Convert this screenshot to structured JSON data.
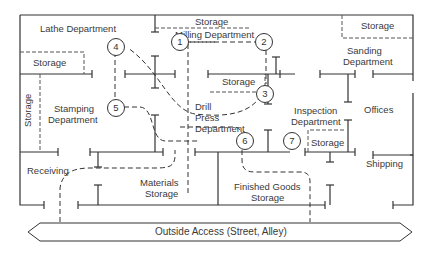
{
  "diagram": {
    "colors": {
      "line": "#333333",
      "text": "#3a3a3a",
      "background": "#ffffff"
    }
  },
  "areas": {
    "lathe": "Lathe Department",
    "storage_top_mid": "Storage",
    "milling": "Milling Department",
    "storage_top_right": "Storage",
    "sanding_1": "Sanding",
    "sanding_2": "Department",
    "storage_left": "Storage",
    "storage_vertical": "Storage",
    "stamping_1": "Stamping",
    "stamping_2": "Department",
    "storage_center": "Storage",
    "drill_1": "Drill",
    "drill_2": "Press",
    "drill_3": "Department",
    "inspection_1": "Inspection",
    "inspection_2": "Department",
    "offices": "Offices",
    "storage_inspection": "Storage",
    "receiving": "Receiving",
    "shipping": "Shipping",
    "materials_1": "Materials",
    "materials_2": "Storage",
    "finished_1": "Finished Goods",
    "finished_2": "Storage",
    "outside_access": "Outside Access (Street, Alley)"
  },
  "nodes": [
    {
      "id": "1",
      "label": "1"
    },
    {
      "id": "2",
      "label": "2"
    },
    {
      "id": "3",
      "label": "3"
    },
    {
      "id": "4",
      "label": "4"
    },
    {
      "id": "5",
      "label": "5"
    },
    {
      "id": "6",
      "label": "6"
    },
    {
      "id": "7",
      "label": "7"
    }
  ],
  "flow_sequence": [
    "Receiving",
    "Materials Storage",
    "Drill Press Department",
    "1",
    "2",
    "3",
    "4",
    "5",
    "6",
    "7",
    "Shipping"
  ]
}
